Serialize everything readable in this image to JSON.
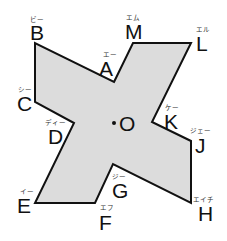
{
  "diagram": {
    "type": "point-symmetric-figure",
    "shape": {
      "fill": "#dcdcdc",
      "stroke": "#111111",
      "points_order": [
        "A",
        "M",
        "L",
        "K",
        "J",
        "H",
        "G",
        "F",
        "E",
        "D",
        "C",
        "B"
      ]
    },
    "vertices": {
      "A": {
        "x": 114,
        "y": 82,
        "label": "A",
        "ruby": "エー"
      },
      "B": {
        "x": 35,
        "y": 43,
        "label": "B",
        "ruby": "ビー"
      },
      "C": {
        "x": 35,
        "y": 102,
        "label": "C",
        "ruby": "シー"
      },
      "D": {
        "x": 74,
        "y": 123,
        "label": "D",
        "ruby": "ディー"
      },
      "E": {
        "x": 35,
        "y": 203,
        "label": "E",
        "ruby": "イー"
      },
      "F": {
        "x": 95,
        "y": 203,
        "label": "F",
        "ruby": "エフ"
      },
      "G": {
        "x": 113,
        "y": 164,
        "label": "G",
        "ruby": "ジー"
      },
      "H": {
        "x": 191,
        "y": 203,
        "label": "H",
        "ruby": "エイチ"
      },
      "J": {
        "x": 191,
        "y": 141,
        "label": "J",
        "ruby": "ジェー"
      },
      "K": {
        "x": 152,
        "y": 122,
        "label": "K",
        "ruby": "ケー"
      },
      "L": {
        "x": 191,
        "y": 43,
        "label": "L",
        "ruby": "エル"
      },
      "M": {
        "x": 133,
        "y": 43,
        "label": "M",
        "ruby": "エム"
      }
    },
    "center": {
      "x": 114,
      "y": 123,
      "label": "O"
    }
  }
}
